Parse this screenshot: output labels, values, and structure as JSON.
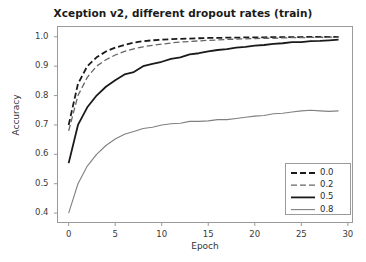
{
  "chart_data": {
    "type": "line",
    "title": "Xception v2, different dropout rates (train)",
    "xlabel": "Epoch",
    "ylabel": "Accuracy",
    "xlim": [
      -1.2,
      30.5
    ],
    "ylim": [
      0.368,
      1.035
    ],
    "xticks": [
      0,
      5,
      10,
      15,
      20,
      25,
      30
    ],
    "xtick_labels": [
      "0",
      "5",
      "10",
      "15",
      "20",
      "25",
      "30"
    ],
    "yticks": [
      0.4,
      0.5,
      0.6,
      0.7,
      0.8,
      0.9,
      1.0
    ],
    "ytick_labels": [
      "0.4",
      "0.5",
      "0.6",
      "0.7",
      "0.8",
      "0.9",
      "1.0"
    ],
    "grid": false,
    "legend_position": "lower right",
    "legend_title": "",
    "x": [
      0,
      1,
      2,
      3,
      4,
      5,
      6,
      7,
      8,
      9,
      10,
      11,
      12,
      13,
      14,
      15,
      16,
      17,
      18,
      19,
      20,
      21,
      22,
      23,
      24,
      25,
      26,
      27,
      28,
      29
    ],
    "series": [
      {
        "name": "0.0",
        "label": "0.0",
        "color": "#1a1a1a",
        "linestyle": "dashed",
        "linewidth": 1.8,
        "dasharray": "6,3",
        "values": [
          0.7,
          0.84,
          0.9,
          0.93,
          0.95,
          0.963,
          0.972,
          0.98,
          0.985,
          0.988,
          0.99,
          0.992,
          0.993,
          0.994,
          0.995,
          0.996,
          0.996,
          0.997,
          0.997,
          0.998,
          0.998,
          0.998,
          0.999,
          0.999,
          0.999,
          0.999,
          1.0,
          1.0,
          1.0,
          1.0
        ]
      },
      {
        "name": "0.2",
        "label": "0.2",
        "color": "#666666",
        "linestyle": "dashed",
        "linewidth": 1.3,
        "dasharray": "6,3",
        "values": [
          0.68,
          0.8,
          0.862,
          0.9,
          0.922,
          0.938,
          0.95,
          0.959,
          0.966,
          0.971,
          0.975,
          0.979,
          0.982,
          0.984,
          0.986,
          0.988,
          0.989,
          0.991,
          0.992,
          0.993,
          0.994,
          0.995,
          0.995,
          0.996,
          0.997,
          0.997,
          0.998,
          0.998,
          0.999,
          0.999
        ]
      },
      {
        "name": "0.5",
        "label": "0.5",
        "color": "#1a1a1a",
        "linestyle": "solid",
        "linewidth": 1.8,
        "dasharray": "",
        "values": [
          0.57,
          0.7,
          0.76,
          0.8,
          0.83,
          0.852,
          0.872,
          0.88,
          0.9,
          0.908,
          0.915,
          0.925,
          0.93,
          0.94,
          0.944,
          0.95,
          0.955,
          0.958,
          0.963,
          0.966,
          0.97,
          0.972,
          0.976,
          0.978,
          0.982,
          0.982,
          0.985,
          0.986,
          0.988,
          0.99
        ]
      },
      {
        "name": "0.8",
        "label": "0.8",
        "color": "#808080",
        "linestyle": "solid",
        "linewidth": 1.1,
        "dasharray": "",
        "values": [
          0.4,
          0.5,
          0.56,
          0.6,
          0.63,
          0.652,
          0.668,
          0.678,
          0.688,
          0.692,
          0.7,
          0.704,
          0.706,
          0.712,
          0.712,
          0.714,
          0.718,
          0.718,
          0.722,
          0.726,
          0.73,
          0.732,
          0.738,
          0.74,
          0.744,
          0.748,
          0.75,
          0.748,
          0.746,
          0.748
        ]
      }
    ]
  },
  "figure": {
    "background": "#ffffff",
    "frame_color": "#9a9a9a",
    "tick_color": "#9a9a9a",
    "text_color": "#222222"
  }
}
